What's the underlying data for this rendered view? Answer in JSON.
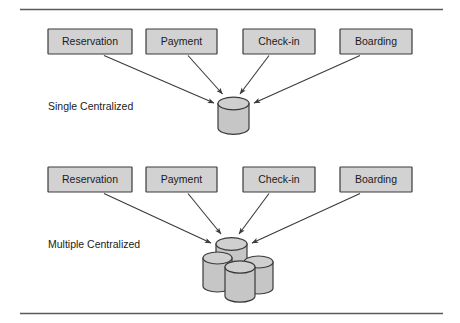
{
  "diagram": {
    "title_rules": {
      "top_rule": "horizontal-rule",
      "bottom_rule": "horizontal-rule"
    },
    "rows": [
      {
        "id": "single-centralized",
        "label": "Single Centralized",
        "boxes": [
          {
            "label": "Reservation"
          },
          {
            "label": "Payment"
          },
          {
            "label": "Check-in"
          },
          {
            "label": "Boarding"
          }
        ],
        "database": {
          "kind": "single-cylinder",
          "count": 1
        }
      },
      {
        "id": "multiple-centralized",
        "label": "Multiple Centralized",
        "boxes": [
          {
            "label": "Reservation"
          },
          {
            "label": "Payment"
          },
          {
            "label": "Check-in"
          },
          {
            "label": "Boarding"
          }
        ],
        "database": {
          "kind": "multi-cylinder",
          "count": 4
        }
      }
    ],
    "colors": {
      "box_fill": "#d2d2d2",
      "box_stroke": "#3a3a3a",
      "cylinder_fill": "#c6c6c6",
      "cylinder_top_fill": "#cfcfcf",
      "line": "#3a3a3a",
      "rule": "#58595b",
      "text": "#1a1a1a",
      "background": "#ffffff"
    }
  }
}
